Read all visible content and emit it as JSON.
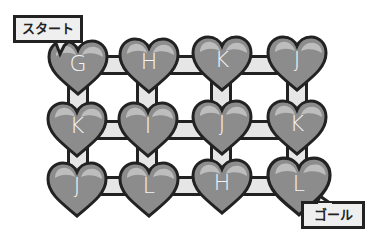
{
  "puzzle": {
    "start_label": "スタート",
    "goal_label": "ゴール",
    "rows": [
      [
        "G",
        "H",
        "K",
        "J"
      ],
      [
        "K",
        "I",
        "J",
        "K"
      ],
      [
        "J",
        "L",
        "H",
        "L"
      ]
    ],
    "start_cell": "row0-col0",
    "goal_cell": "row2-col3"
  },
  "colors": {
    "heart_fill": "#8c8c8c",
    "heart_outline": "#222222",
    "heart_highlight": "#bdbdbd",
    "bar_fill": "#e6e6e6",
    "label_bg": "#efefef",
    "letter": "#f4f4f4"
  }
}
